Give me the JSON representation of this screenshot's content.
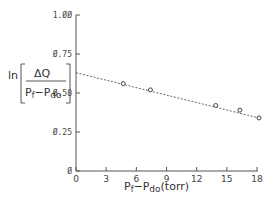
{
  "chart_data": {
    "type": "scatter",
    "title": "",
    "xlabel": "Pf−Pdo (torr)",
    "xlabel_parts": {
      "main": "P",
      "sub1": "f",
      "dash": "−P",
      "sub2": "do",
      "unit": "(torr)"
    },
    "ylabel": "ln[ΔQ / (Pf−Pdo)]",
    "ylabel_parts": {
      "ln": "ln",
      "numerator": "ΔQ",
      "den_main": "P",
      "den_sub1": "f",
      "den_dash": "−P",
      "den_sub2": "do"
    },
    "xlim": [
      0,
      18
    ],
    "ylim": [
      0,
      1.0
    ],
    "x_ticks": [
      "0",
      "3",
      "6",
      "9",
      "12",
      "15",
      "18"
    ],
    "x_tick_values": [
      0,
      3,
      6,
      9,
      12,
      15,
      18
    ],
    "y_ticks": [
      "Ø",
      "Ø.25",
      "Ø.50",
      "Ø.75",
      "1.ØØ"
    ],
    "y_tick_values": [
      0,
      0.25,
      0.5,
      0.75,
      1.0
    ],
    "grid": false,
    "series": [
      {
        "name": "measured",
        "marker": "open-circle",
        "x": [
          4.7,
          7.4,
          13.9,
          16.3,
          18.2
        ],
        "y": [
          0.56,
          0.52,
          0.42,
          0.39,
          0.34
        ]
      },
      {
        "name": "fit",
        "style": "dashed-line",
        "x": [
          0,
          18.2
        ],
        "y": [
          0.63,
          0.34
        ]
      }
    ],
    "colors": {
      "axis": "#555555",
      "marker": "#444444",
      "line": "#555555"
    }
  }
}
